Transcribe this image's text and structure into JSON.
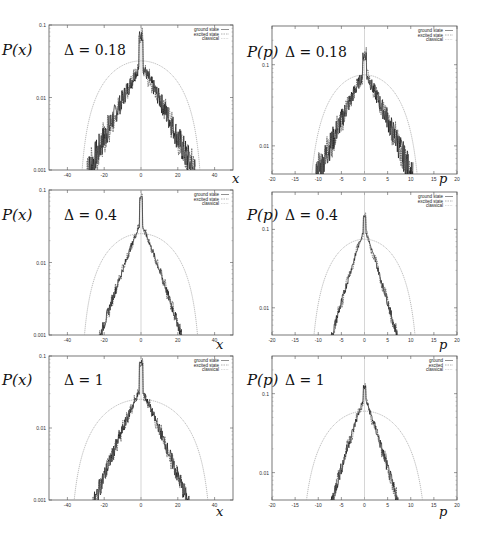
{
  "chart_data": [
    {
      "type": "line",
      "id": "x-0.18",
      "ylabel": "P(x)",
      "annotation": "Δ = 0.18",
      "xlabel": "x",
      "xlim": [
        -50,
        50
      ],
      "ylim": [
        0.001,
        0.1
      ],
      "yscale": "log",
      "xticks": [
        -40,
        -20,
        0,
        20,
        40
      ],
      "yticks": [
        0.001,
        0.01,
        0.1
      ],
      "ytick_labels": [
        "0.001",
        "0.01",
        "0.1"
      ],
      "legend": [
        "ground state",
        "excited state",
        "classical"
      ],
      "legend_position": "top-right",
      "classical": {
        "peak": 0.032,
        "half_width": 34
      },
      "quantum": {
        "peak": 0.07,
        "base": 0.028,
        "decay_width": 28,
        "noise": 0.35
      }
    },
    {
      "type": "line",
      "id": "p-0.18",
      "ylabel": "P(p)",
      "annotation": "Δ = 0.18",
      "xlabel": "p",
      "xlim": [
        -20,
        20
      ],
      "ylim": [
        0.0045,
        0.3
      ],
      "yscale": "log",
      "xticks": [
        -20,
        -15,
        -10,
        -5,
        0,
        5,
        10,
        15,
        20
      ],
      "yticks": [
        0.01,
        0.1
      ],
      "ytick_labels": [
        "0.01",
        "0.1"
      ],
      "legend": [
        "ground state",
        "excited state",
        "classical"
      ],
      "legend_position": "top-right",
      "classical": {
        "peak": 0.075,
        "half_width": 12.5
      },
      "quantum": {
        "peak": 0.13,
        "base": 0.08,
        "decay_width": 10,
        "noise": 0.3
      }
    },
    {
      "type": "line",
      "id": "x-0.4",
      "ylabel": "P(x)",
      "annotation": "Δ = 0.4",
      "xlabel": "x",
      "xlim": [
        -50,
        50
      ],
      "ylim": [
        0.001,
        0.1
      ],
      "yscale": "log",
      "xticks": [
        -40,
        -20,
        0,
        20,
        40
      ],
      "yticks": [
        0.001,
        0.01,
        0.1
      ],
      "ytick_labels": [
        "0.001",
        "0.01",
        "0.1"
      ],
      "legend": [
        "ground state",
        "excited state",
        "classical"
      ],
      "legend_position": "top-right",
      "classical": {
        "peak": 0.025,
        "half_width": 33
      },
      "quantum": {
        "peak": 0.08,
        "base": 0.035,
        "decay_width": 22,
        "noise": 0.12
      }
    },
    {
      "type": "line",
      "id": "p-0.4",
      "ylabel": "P(p)",
      "annotation": "Δ = 0.4",
      "xlabel": "p",
      "xlim": [
        -20,
        20
      ],
      "ylim": [
        0.0045,
        0.3
      ],
      "yscale": "log",
      "xticks": [
        -20,
        -15,
        -10,
        -5,
        0,
        5,
        10,
        15,
        20
      ],
      "yticks": [
        0.01,
        0.1
      ],
      "ytick_labels": [
        "0.01",
        "0.1"
      ],
      "legend": [
        "ground state",
        "excited state",
        "classical"
      ],
      "legend_position": "top-right",
      "classical": {
        "peak": 0.075,
        "half_width": 12
      },
      "quantum": {
        "peak": 0.15,
        "base": 0.1,
        "decay_width": 7,
        "noise": 0.1
      }
    },
    {
      "type": "line",
      "id": "x-1",
      "ylabel": "P(x)",
      "annotation": "Δ = 1",
      "xlabel": "x",
      "xlim": [
        -50,
        50
      ],
      "ylim": [
        0.001,
        0.1
      ],
      "yscale": "log",
      "xticks": [
        -40,
        -20,
        0,
        20,
        40
      ],
      "yticks": [
        0.001,
        0.01,
        0.1
      ],
      "ytick_labels": [
        "0.001",
        "0.01",
        "0.1"
      ],
      "legend": [
        "ground state",
        "excited state",
        "classical"
      ],
      "legend_position": "top-right",
      "classical": {
        "peak": 0.025,
        "half_width": 39
      },
      "quantum": {
        "peak": 0.08,
        "base": 0.035,
        "decay_width": 25,
        "noise": 0.2
      }
    },
    {
      "type": "line",
      "id": "p-1",
      "ylabel": "P(p)",
      "annotation": "Δ = 1",
      "xlabel": "p",
      "xlim": [
        -20,
        20
      ],
      "ylim": [
        0.0045,
        0.3
      ],
      "yscale": "log",
      "xticks": [
        -20,
        -15,
        -10,
        -5,
        0,
        5,
        10,
        15,
        20
      ],
      "yticks": [
        0.01,
        0.1
      ],
      "ytick_labels": [
        "0.01",
        "0.1"
      ],
      "legend": [
        "ground",
        "excited",
        "classical"
      ],
      "legend_position": "top-right",
      "classical": {
        "peak": 0.06,
        "half_width": 14
      },
      "quantum": {
        "peak": 0.12,
        "base": 0.09,
        "decay_width": 7,
        "noise": 0.15
      }
    }
  ]
}
